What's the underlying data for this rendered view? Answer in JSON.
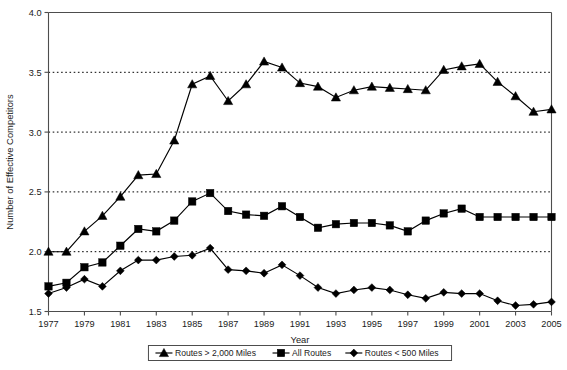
{
  "chart_data": {
    "type": "line",
    "title": "",
    "xlabel": "Year",
    "ylabel": "Number of Effective Competitors",
    "xlim": [
      1977,
      2005
    ],
    "ylim": [
      1.5,
      4.0
    ],
    "yticks": [
      "1.5",
      "2.0",
      "2.5",
      "3.0",
      "3.5",
      "4.0"
    ],
    "ytick_values": [
      1.5,
      2.0,
      2.5,
      3.0,
      3.5,
      4.0
    ],
    "grid": "horizontal-dotted",
    "legend_position": "below-plot-center",
    "x": [
      1977,
      1978,
      1979,
      1980,
      1981,
      1982,
      1983,
      1984,
      1985,
      1986,
      1987,
      1988,
      1989,
      1990,
      1991,
      1992,
      1993,
      1994,
      1995,
      1996,
      1997,
      1998,
      1999,
      2000,
      2001,
      2002,
      2003,
      2004,
      2005
    ],
    "xtick_labels": [
      "1977",
      "1979",
      "1981",
      "1983",
      "1985",
      "1987",
      "1989",
      "1991",
      "1993",
      "1995",
      "1997",
      "1999",
      "2001",
      "2003",
      "2005"
    ],
    "xtick_values": [
      1977,
      1979,
      1981,
      1983,
      1985,
      1987,
      1989,
      1991,
      1993,
      1995,
      1997,
      1999,
      2001,
      2003,
      2005
    ],
    "series": [
      {
        "name": "Routes > 2,000 Miles",
        "marker": "triangle",
        "color": "#000000",
        "values": [
          2.0,
          2.0,
          2.17,
          2.3,
          2.46,
          2.64,
          2.65,
          2.93,
          3.4,
          3.47,
          3.26,
          3.4,
          3.59,
          3.54,
          3.41,
          3.38,
          3.29,
          3.35,
          3.38,
          3.37,
          3.36,
          3.35,
          3.52,
          3.55,
          3.57,
          3.42,
          3.3,
          3.17,
          3.19
        ]
      },
      {
        "name": "All Routes",
        "marker": "square",
        "color": "#000000",
        "values": [
          1.71,
          1.74,
          1.87,
          1.91,
          2.05,
          2.19,
          2.17,
          2.26,
          2.42,
          2.49,
          2.34,
          2.31,
          2.3,
          2.38,
          2.29,
          2.2,
          2.23,
          2.24,
          2.24,
          2.22,
          2.17,
          2.26,
          2.32,
          2.36,
          2.29,
          2.29,
          2.29,
          2.29,
          2.29
        ]
      },
      {
        "name": "Routes < 500 Miles",
        "marker": "diamond",
        "color": "#000000",
        "values": [
          1.65,
          1.7,
          1.77,
          1.71,
          1.84,
          1.93,
          1.93,
          1.96,
          1.97,
          2.03,
          1.85,
          1.84,
          1.82,
          1.89,
          1.8,
          1.7,
          1.65,
          1.68,
          1.7,
          1.68,
          1.64,
          1.61,
          1.66,
          1.65,
          1.65,
          1.59,
          1.55,
          1.56,
          1.58
        ]
      }
    ]
  }
}
